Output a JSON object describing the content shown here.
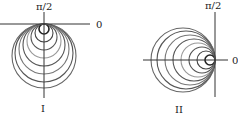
{
  "figures": [
    {
      "id": "I",
      "caption": "I",
      "axis_label_zero": "0",
      "axis_label_half_pi": "π/2",
      "orientation": "circles tangent at pole, extending downward",
      "circle_radii": [
        5,
        9,
        13,
        17,
        21,
        25,
        29,
        32
      ],
      "circle_colors": [
        "#222222",
        "#444444",
        "#555555",
        "#999999",
        "#555555",
        "#777777",
        "#555555",
        "#666666"
      ]
    },
    {
      "id": "II",
      "caption": "II",
      "axis_label_zero": "0",
      "axis_label_half_pi": "π/2",
      "orientation": "circles tangent at pole, extending left",
      "circle_radii": [
        5,
        9,
        13,
        17,
        21,
        25,
        29,
        32
      ],
      "circle_colors": [
        "#222222",
        "#444444",
        "#555555",
        "#999999",
        "#555555",
        "#777777",
        "#555555",
        "#666666"
      ]
    }
  ]
}
